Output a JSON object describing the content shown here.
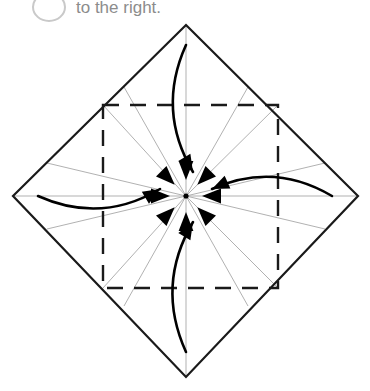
{
  "page": {
    "background_color": "#ffffff",
    "width": 370,
    "height": 391
  },
  "instruction": {
    "step_number": "",
    "text": "to the right.",
    "text_color": "#8c8c8c",
    "badge_border_color": "#c9c9c9",
    "badge_name": "step-number-badge"
  },
  "diagram": {
    "type": "origami-fold-diagram",
    "center": {
      "x": 186,
      "y": 196
    },
    "colors": {
      "outline": "#1a1a1a",
      "crease_thin": "#a8a8a8",
      "dashed": "#1a1a1a",
      "arrow": "#000000"
    },
    "outer_shape": {
      "name": "paper-diamond-outline",
      "kind": "rotated-square",
      "stroke_width": 2.2,
      "vertices": [
        {
          "label": "top",
          "x": 186,
          "y": 25
        },
        {
          "label": "right",
          "x": 358,
          "y": 196
        },
        {
          "label": "bottom",
          "x": 186,
          "y": 377
        },
        {
          "label": "left",
          "x": 13,
          "y": 196
        }
      ]
    },
    "inner_dashed_square": {
      "name": "inner-dashed-square",
      "stroke_width": 2.4,
      "dash_pattern": "16 11",
      "corners": [
        {
          "label": "top-left",
          "x": 103,
          "y": 105
        },
        {
          "label": "top-right",
          "x": 278,
          "y": 105
        },
        {
          "label": "bottom-right",
          "x": 278,
          "y": 288
        },
        {
          "label": "bottom-left",
          "x": 103,
          "y": 288
        }
      ]
    },
    "crease_lines": {
      "name": "radial-crease-lines",
      "stroke_width": 0.9,
      "count": 16,
      "endpoints": [
        {
          "x": 186,
          "y": 25
        },
        {
          "x": 248,
          "y": 87
        },
        {
          "x": 278,
          "y": 105
        },
        {
          "x": 325,
          "y": 163
        },
        {
          "x": 358,
          "y": 196
        },
        {
          "x": 325,
          "y": 229
        },
        {
          "x": 278,
          "y": 288
        },
        {
          "x": 248,
          "y": 306
        },
        {
          "x": 186,
          "y": 377
        },
        {
          "x": 124,
          "y": 306
        },
        {
          "x": 103,
          "y": 288
        },
        {
          "x": 47,
          "y": 229
        },
        {
          "x": 13,
          "y": 196
        },
        {
          "x": 47,
          "y": 163
        },
        {
          "x": 103,
          "y": 105
        },
        {
          "x": 124,
          "y": 87
        }
      ]
    },
    "convergence_arrowheads": {
      "name": "center-convergence-arrowheads",
      "count": 8,
      "description": "Bold solid arrowheads pointing inward to the center point",
      "angles_deg": [
        90,
        135,
        180,
        225,
        270,
        315,
        0,
        45
      ]
    },
    "curved_arrows": [
      {
        "name": "fold-arrow-top",
        "from": {
          "x": 186,
          "y": 45
        },
        "to": {
          "x": 193,
          "y": 172
        },
        "direction": "downward-to-center",
        "bulge": "right"
      },
      {
        "name": "fold-arrow-bottom",
        "from": {
          "x": 186,
          "y": 352
        },
        "to": {
          "x": 193,
          "y": 222
        },
        "direction": "upward-to-center",
        "bulge": "left"
      },
      {
        "name": "fold-arrow-left",
        "from": {
          "x": 38,
          "y": 196
        },
        "to": {
          "x": 160,
          "y": 189
        },
        "direction": "rightward-to-center",
        "bulge": "down"
      },
      {
        "name": "fold-arrow-right",
        "from": {
          "x": 332,
          "y": 196
        },
        "to": {
          "x": 212,
          "y": 189
        },
        "direction": "leftward-to-center",
        "bulge": "down"
      }
    ]
  }
}
